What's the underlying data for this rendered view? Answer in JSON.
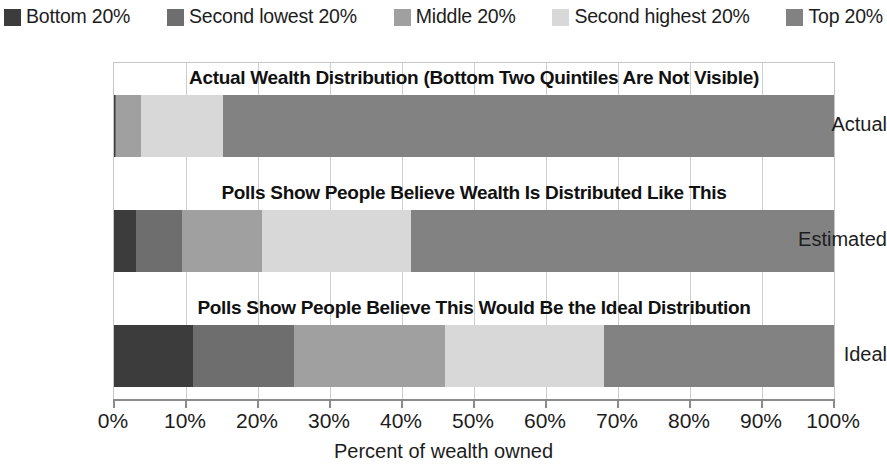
{
  "legend": {
    "items": [
      {
        "label": "Bottom 20%",
        "color": "#3c3c3c",
        "key": "bottom"
      },
      {
        "label": "Second lowest 20%",
        "color": "#6e6e6e",
        "key": "second_lowest"
      },
      {
        "label": "Middle 20%",
        "color": "#a0a0a0",
        "key": "middle"
      },
      {
        "label": "Second highest 20%",
        "color": "#d8d8d8",
        "key": "second_highest"
      },
      {
        "label": "Top 20%",
        "color": "#828282",
        "key": "top"
      }
    ]
  },
  "chart_data": {
    "type": "bar",
    "orientation": "horizontal",
    "stacked": true,
    "title": "",
    "xlabel": "Percent of wealth owned",
    "ylabel": "",
    "categories": [
      "Actual",
      "Estimated",
      "Ideal"
    ],
    "xlim": [
      0,
      100
    ],
    "xticks": [
      "0%",
      "10%",
      "20%",
      "30%",
      "40%",
      "50%",
      "60%",
      "70%",
      "80%",
      "90%",
      "100%"
    ],
    "grid": "vertical",
    "legend_position": "top",
    "series": [
      {
        "name": "Bottom 20%",
        "color": "#3c3c3c",
        "values": [
          0.1,
          3.0,
          11.0
        ]
      },
      {
        "name": "Second lowest 20%",
        "color": "#6e6e6e",
        "values": [
          0.2,
          6.4,
          14.0
        ]
      },
      {
        "name": "Middle 20%",
        "color": "#a0a0a0",
        "values": [
          3.5,
          11.1,
          21.0
        ]
      },
      {
        "name": "Second highest 20%",
        "color": "#d8d8d8",
        "values": [
          11.3,
          20.8,
          22.0
        ]
      },
      {
        "name": "Top 20%",
        "color": "#828282",
        "values": [
          84.9,
          58.7,
          32.0
        ]
      }
    ],
    "annotations": [
      {
        "category": "Actual",
        "text": "Actual Wealth Distribution (Bottom Two Quintiles Are Not Visible)"
      },
      {
        "category": "Estimated",
        "text": "Polls Show People Believe Wealth Is Distributed Like This"
      },
      {
        "category": "Ideal",
        "text": "Polls Show People Believe This Would Be the Ideal Distribution"
      }
    ]
  }
}
